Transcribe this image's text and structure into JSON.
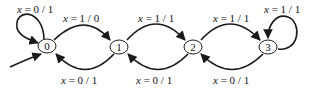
{
  "diagram": {
    "type": "state-machine",
    "colors": {
      "stroke": "#1a1a1a",
      "background": "#ffffff"
    },
    "start_state": "0",
    "states": [
      {
        "id": "0",
        "label": "0"
      },
      {
        "id": "1",
        "label": "1"
      },
      {
        "id": "2",
        "label": "2"
      },
      {
        "id": "3",
        "label": "3"
      }
    ],
    "transitions": [
      {
        "from": "0",
        "to": "0",
        "var": "x",
        "eq": " = ",
        "label": "0 / 1"
      },
      {
        "from": "0",
        "to": "1",
        "var": "x",
        "eq": " = ",
        "label": "1 / 0"
      },
      {
        "from": "1",
        "to": "0",
        "var": "x",
        "eq": " = ",
        "label": "0 / 1"
      },
      {
        "from": "1",
        "to": "2",
        "var": "x",
        "eq": " = ",
        "label": "1 / 1"
      },
      {
        "from": "2",
        "to": "1",
        "var": "x",
        "eq": " = ",
        "label": "0 / 1"
      },
      {
        "from": "2",
        "to": "3",
        "var": "x",
        "eq": " = ",
        "label": "1 / 1"
      },
      {
        "from": "3",
        "to": "2",
        "var": "x",
        "eq": " = ",
        "label": "0 / 1"
      },
      {
        "from": "3",
        "to": "3",
        "var": "x",
        "eq": " = ",
        "label": "1 / 1"
      }
    ]
  }
}
